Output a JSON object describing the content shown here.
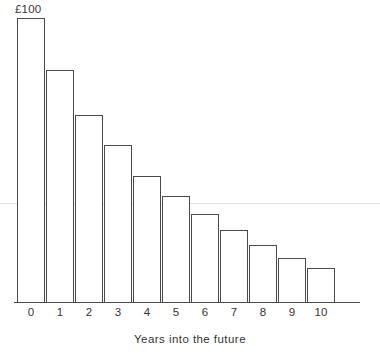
{
  "chart_data": {
    "type": "bar",
    "title": "",
    "subtitle": "",
    "xlabel": "Years into the future",
    "ylabel": "",
    "categories": [
      "0",
      "1",
      "2",
      "3",
      "4",
      "5",
      "6",
      "7",
      "8",
      "9",
      "10"
    ],
    "values": [
      100,
      82,
      66,
      55,
      45,
      37,
      31,
      25,
      20,
      16,
      12
    ],
    "value_labels": [
      "£100",
      "",
      "",
      "",
      "",
      "",
      "",
      "",
      "",
      "",
      ""
    ],
    "ylim": [
      0,
      100
    ],
    "grid": false,
    "legend": "none",
    "annotations": [
      {
        "text": "£100",
        "target_category": "0",
        "position": "above-bar"
      }
    ],
    "style": {
      "bar_fill": "#ffffff",
      "bar_stroke": "#4a4a4a",
      "axis_color": "#4a4a4a",
      "text_color": "#333333",
      "background": "#ffffff"
    }
  },
  "axis": {
    "x_tick_labels": [
      "0",
      "1",
      "2",
      "3",
      "4",
      "5",
      "6",
      "7",
      "8",
      "9",
      "10"
    ],
    "x_axis_title": "Years into the future"
  },
  "bars": [
    {
      "label": "0",
      "value": 100,
      "value_label": "£100",
      "left": 17,
      "width": 28,
      "top": 18
    },
    {
      "label": "1",
      "value": 82,
      "value_label": "",
      "left": 46,
      "width": 28,
      "top": 70
    },
    {
      "label": "2",
      "value": 66,
      "value_label": "",
      "left": 75,
      "width": 28,
      "top": 115
    },
    {
      "label": "3",
      "value": 55,
      "value_label": "",
      "left": 104,
      "width": 28,
      "top": 145
    },
    {
      "label": "4",
      "value": 45,
      "value_label": "",
      "left": 133,
      "width": 28,
      "top": 176
    },
    {
      "label": "5",
      "value": 37,
      "value_label": "",
      "left": 162,
      "width": 28,
      "top": 196
    },
    {
      "label": "6",
      "value": 31,
      "value_label": "",
      "left": 191,
      "width": 28,
      "top": 214
    },
    {
      "label": "7",
      "value": 25,
      "value_label": "",
      "left": 220,
      "width": 28,
      "top": 230
    },
    {
      "label": "8",
      "value": 20,
      "value_label": "",
      "left": 249,
      "width": 28,
      "top": 245
    },
    {
      "label": "9",
      "value": 16,
      "value_label": "",
      "left": 278,
      "width": 28,
      "top": 258
    },
    {
      "label": "10",
      "value": 12,
      "value_label": "",
      "left": 307,
      "width": 28,
      "top": 268
    }
  ]
}
